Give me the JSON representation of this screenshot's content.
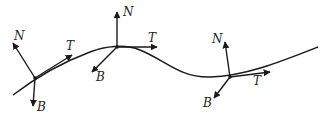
{
  "diagram": {
    "curve": "smooth curve",
    "frames": [
      {
        "point": [
          35,
          78
        ],
        "labels": {
          "N": "N",
          "T": "T",
          "B": "B"
        },
        "N_tip": [
          13,
          43
        ],
        "T_tip": [
          72,
          55
        ],
        "B_tip": [
          33,
          106
        ],
        "N_label": [
          14,
          40
        ],
        "T_label": [
          66,
          50
        ],
        "B_label": [
          37,
          111
        ]
      },
      {
        "point": [
          117,
          47
        ],
        "labels": {
          "N": "N",
          "T": "T",
          "B": "B"
        },
        "N_tip": [
          117,
          12
        ],
        "T_tip": [
          157,
          47
        ],
        "B_tip": [
          92,
          72
        ],
        "N_label": [
          123,
          16
        ],
        "T_label": [
          148,
          42
        ],
        "B_label": [
          96,
          81
        ]
      },
      {
        "point": [
          230,
          77
        ],
        "labels": {
          "N": "N",
          "T": "T",
          "B": "B"
        },
        "N_tip": [
          225,
          42
        ],
        "T_tip": [
          270,
          72
        ],
        "B_tip": [
          214,
          98
        ],
        "N_label": [
          212,
          43
        ],
        "T_label": [
          253,
          85
        ],
        "B_label": [
          203,
          107
        ]
      }
    ],
    "color": "#1a1a1a"
  }
}
